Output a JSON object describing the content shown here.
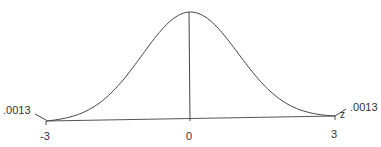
{
  "chart_data": {
    "type": "line",
    "title": "",
    "xlabel": "z",
    "ylabel": "",
    "x_ticks": [
      "-3",
      "0",
      "3"
    ],
    "xlim": [
      -3,
      3
    ],
    "grid": false,
    "legend": null,
    "annotations": [
      {
        "text": ".0013",
        "position": "left tail at z=-3"
      },
      {
        "text": ".0013",
        "position": "right tail at z=3"
      }
    ],
    "series": [
      {
        "name": "standard normal density",
        "x": [
          -3,
          -2.5,
          -2,
          -1.5,
          -1,
          -0.5,
          0,
          0.5,
          1,
          1.5,
          2,
          2.5,
          3
        ],
        "values": [
          0.0044,
          0.0175,
          0.054,
          0.1295,
          0.242,
          0.3521,
          0.3989,
          0.3521,
          0.242,
          0.1295,
          0.054,
          0.0175,
          0.0044
        ]
      }
    ]
  },
  "labels": {
    "tail_left": ".0013",
    "tail_right": ".0013",
    "tick_left": "-3",
    "tick_mid": "0",
    "tick_right": "3",
    "axis_var": "z"
  },
  "colors": {
    "line": "#444444",
    "text": "#333333"
  }
}
